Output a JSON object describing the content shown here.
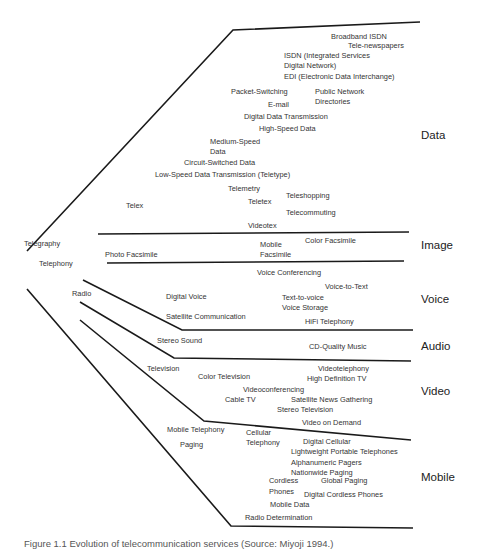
{
  "diagram": {
    "categories": {
      "data": "Data",
      "image": "Image",
      "voice": "Voice",
      "audio": "Audio",
      "video": "Video",
      "mobile": "Mobile"
    },
    "roots": {
      "telegraphy": "Telegraphy",
      "telephony": "Telephony",
      "radio": "Radio",
      "telex": "Telex",
      "television": "Television"
    },
    "data_services": {
      "broadband_isdn": "Broadband ISDN",
      "tele_newspapers": "Tele-newspapers",
      "isdn_1": "ISDN (Integrated Services",
      "isdn_2": "Digital Network)",
      "edi": "EDI (Electronic Data Interchange)",
      "packet_switching": "Packet-Switching",
      "public_network_1": "Public Network",
      "public_network_2": "Directories",
      "email": "E-mail",
      "digital_data_transmission": "Digital Data Transmission",
      "high_speed_data": "High-Speed Data",
      "medium_speed_1": "Medium-Speed",
      "medium_speed_2": "Data",
      "circuit_switched": "Circuit-Switched Data",
      "low_speed": "Low-Speed Data Transmission (Teletype)",
      "telemetry": "Telemetry",
      "teleshopping": "Teleshopping",
      "teletex": "Teletex",
      "telecommuting": "Telecommuting",
      "videotex": "Videotex"
    },
    "image_services": {
      "photo_facsimile": "Photo Facsimile",
      "mobile_facsimile_1": "Mobile",
      "mobile_facsimile_2": "Facsimile",
      "color_facsimile": "Color Facsimile"
    },
    "voice_services": {
      "voice_conferencing": "Voice Conferencing",
      "voice_to_text": "Voice-to-Text",
      "digital_voice": "Digital Voice",
      "text_to_voice": "Text-to-voice",
      "voice_storage": "Voice Storage",
      "satellite_communication": "Satellite Communication",
      "hifi_telephony": "HiFi Telephony"
    },
    "audio_services": {
      "stereo_sound": "Stereo Sound",
      "cd_quality_music": "CD-Quality Music"
    },
    "video_services": {
      "videotelephony": "Videotelephony",
      "color_television": "Color Television",
      "high_definition_tv": "High Definition TV",
      "videoconferencing": "Videoconferencing",
      "cable_tv": "Cable TV",
      "satellite_news": "Satellite News Gathering",
      "stereo_television": "Stereo Television",
      "video_on_demand": "Video on Demand"
    },
    "mobile_services": {
      "mobile_telephony": "Mobile Telephony",
      "cellular_1": "Cellular",
      "cellular_2": "Telephony",
      "paging": "Paging",
      "digital_cellular": "Digital Cellular",
      "lightweight_phones": "Lightweight Portable Telephones",
      "alphanumeric_pagers": "Alphanumeric Pagers",
      "nationwide_paging": "Nationwide Paging",
      "cordless_1": "Cordless",
      "cordless_2": "Phones",
      "global_paging": "Global Paging",
      "digital_cordless": "Digital Cordless Phones",
      "mobile_data": "Mobile Data",
      "radio_determination": "Radio Determination"
    },
    "caption": "Figure 1.1  Evolution of telecommunication services (Source: Miyoji 1994.)"
  }
}
